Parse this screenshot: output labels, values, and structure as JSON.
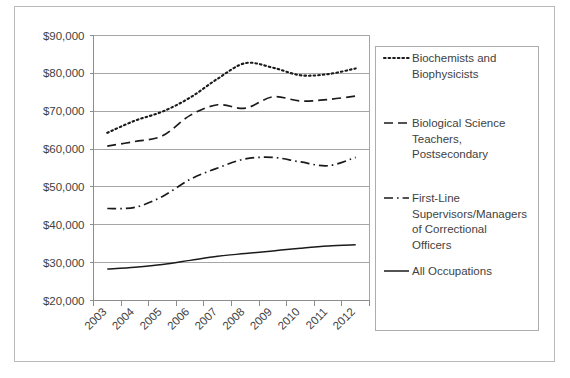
{
  "chart_data": {
    "type": "line",
    "title": "",
    "xlabel": "",
    "ylabel": "",
    "grid": true,
    "legend_position": "right",
    "categories": [
      "2003",
      "2004",
      "2005",
      "2006",
      "2007",
      "2008",
      "2009",
      "2010",
      "2011",
      "2012"
    ],
    "ylim": [
      20000,
      90000
    ],
    "ytick_values": [
      90000,
      80000,
      70000,
      60000,
      50000,
      40000,
      30000,
      20000
    ],
    "ytick_labels": [
      "$90,000",
      "$80,000",
      "$70,000",
      "$60,000",
      "$50,000",
      "$40,000",
      "$30,000",
      "$20,000"
    ],
    "series": [
      {
        "name": "Biochemists and Biophysicists",
        "style": "dotted",
        "values": [
          64300,
          67500,
          69900,
          73600,
          78600,
          82700,
          81500,
          79500,
          79800,
          81300
        ]
      },
      {
        "name": "Biological Science Teachers, Postsecondary",
        "style": "dashed",
        "values": [
          60800,
          62000,
          63500,
          68900,
          71700,
          70800,
          73800,
          72700,
          73100,
          74000
        ]
      },
      {
        "name": "First-Line Supervisors/Managers of Correctional Officers",
        "style": "dashdot",
        "values": [
          44300,
          44600,
          47500,
          52000,
          55000,
          57400,
          57800,
          56600,
          55600,
          57800
        ]
      },
      {
        "name": "All Occupations",
        "style": "solid",
        "values": [
          28300,
          28800,
          29500,
          30600,
          31700,
          32400,
          33100,
          33800,
          34400,
          34750
        ]
      }
    ]
  },
  "legend": {
    "entries": [
      {
        "label_line1": "Biochemists and",
        "label_line2": "Biophysicists",
        "label_line3": "",
        "label_line4": ""
      },
      {
        "label_line1": "Biological Science",
        "label_line2": "Teachers,",
        "label_line3": "Postsecondary",
        "label_line4": ""
      },
      {
        "label_line1": "First-Line",
        "label_line2": "Supervisors/Managers",
        "label_line3": "of Correctional",
        "label_line4": "Officers"
      },
      {
        "label_line1": "All Occupations",
        "label_line2": "",
        "label_line3": "",
        "label_line4": ""
      }
    ]
  },
  "colors": {
    "line": "#1a1a1a",
    "grid": "#a6a6a6",
    "axis": "#8d8d8d",
    "frame": "#b9b9b9",
    "text": "#3f3f3f",
    "background": "#ffffff"
  }
}
